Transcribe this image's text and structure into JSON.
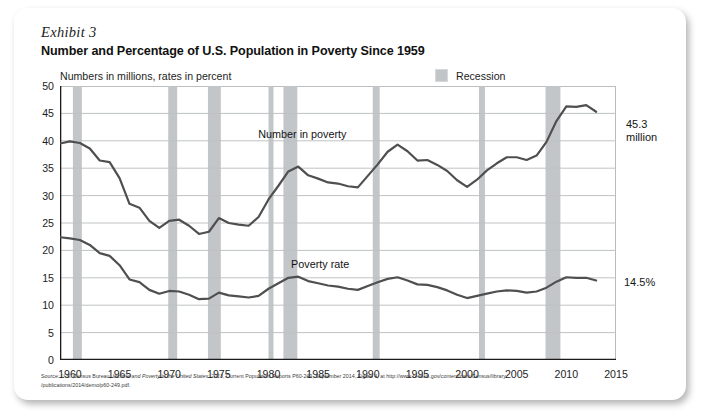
{
  "exhibit": {
    "label": "Exhibit 3",
    "title": "Number and Percentage of U.S. Population in Poverty Since 1959",
    "axis_note": "Numbers in millions, rates in percent"
  },
  "legend": {
    "recession_label": "Recession",
    "recession_color": "#c2c5c7"
  },
  "callouts": {
    "number_value": "45.3",
    "number_unit": "million",
    "rate_value": "14.5%"
  },
  "source": {
    "prefix": "Source: U.S. Census Bureau, ",
    "italic_title": "Income and Poverty in the United States: 2013",
    "rest_line1": ", Current Population Reports P60-249, September 2014, Figure 4, at http://www.census.gov/content/dam/Census/library",
    "line2": "/publications/2014/demo/p60-249.pdf."
  },
  "chart_data": {
    "type": "line",
    "title": "Number and Percentage of U.S. Population in Poverty Since 1959",
    "subtitle": "Numbers in millions, rates in percent",
    "xlabel": "",
    "ylabel": "",
    "xlim": [
      1959,
      2015
    ],
    "ylim": [
      0,
      50
    ],
    "grid": true,
    "legend_position": "top-right",
    "x_ticks": [
      1960,
      1965,
      1970,
      1975,
      1980,
      1985,
      1990,
      1995,
      2000,
      2005,
      2010,
      2015
    ],
    "y_ticks": [
      0,
      5,
      10,
      15,
      20,
      25,
      30,
      35,
      40,
      45,
      50
    ],
    "line_color": "#4f4f4f",
    "x": [
      1959,
      1960,
      1961,
      1962,
      1963,
      1964,
      1965,
      1966,
      1967,
      1968,
      1969,
      1970,
      1971,
      1972,
      1973,
      1974,
      1975,
      1976,
      1977,
      1978,
      1979,
      1980,
      1981,
      1982,
      1983,
      1984,
      1985,
      1986,
      1987,
      1988,
      1989,
      1990,
      1991,
      1992,
      1993,
      1994,
      1995,
      1996,
      1997,
      1998,
      1999,
      2000,
      2001,
      2002,
      2003,
      2004,
      2005,
      2006,
      2007,
      2008,
      2009,
      2010,
      2011,
      2012,
      2013
    ],
    "series": [
      {
        "name": "Number in poverty",
        "unit": "millions",
        "label_position": {
          "x": 1983.2,
          "y": 41.0
        },
        "values": [
          39.5,
          39.9,
          39.6,
          38.6,
          36.4,
          36.1,
          33.2,
          28.5,
          27.8,
          25.4,
          24.1,
          25.4,
          25.6,
          24.5,
          23.0,
          23.4,
          25.9,
          25.0,
          24.7,
          24.5,
          26.1,
          29.3,
          31.8,
          34.4,
          35.3,
          33.7,
          33.1,
          32.4,
          32.2,
          31.7,
          31.5,
          33.6,
          35.7,
          38.0,
          39.3,
          38.1,
          36.4,
          36.5,
          35.6,
          34.5,
          32.8,
          31.6,
          32.9,
          34.6,
          35.9,
          37.0,
          37.0,
          36.5,
          37.3,
          39.8,
          43.6,
          46.3,
          46.2,
          46.5,
          45.3
        ]
      },
      {
        "name": "Poverty rate",
        "unit": "percent",
        "label_position": {
          "x": 1986.5,
          "y": 17.4
        },
        "values": [
          22.4,
          22.2,
          21.9,
          21.0,
          19.5,
          19.0,
          17.3,
          14.7,
          14.2,
          12.8,
          12.1,
          12.6,
          12.5,
          11.9,
          11.1,
          11.2,
          12.3,
          11.8,
          11.6,
          11.4,
          11.7,
          13.0,
          14.0,
          15.0,
          15.2,
          14.4,
          14.0,
          13.6,
          13.4,
          13.0,
          12.8,
          13.5,
          14.2,
          14.8,
          15.1,
          14.5,
          13.8,
          13.7,
          13.3,
          12.7,
          11.9,
          11.3,
          11.7,
          12.1,
          12.5,
          12.7,
          12.6,
          12.3,
          12.5,
          13.2,
          14.3,
          15.1,
          15.0,
          15.0,
          14.5
        ]
      }
    ],
    "recession_bands": [
      {
        "start": 1960.3,
        "end": 1961.2
      },
      {
        "start": 1969.9,
        "end": 1970.8
      },
      {
        "start": 1973.9,
        "end": 1975.2
      },
      {
        "start": 1980.0,
        "end": 1980.5
      },
      {
        "start": 1981.5,
        "end": 1982.9
      },
      {
        "start": 1990.5,
        "end": 1991.2
      },
      {
        "start": 2001.2,
        "end": 2001.8
      },
      {
        "start": 2007.9,
        "end": 2009.4
      }
    ]
  }
}
